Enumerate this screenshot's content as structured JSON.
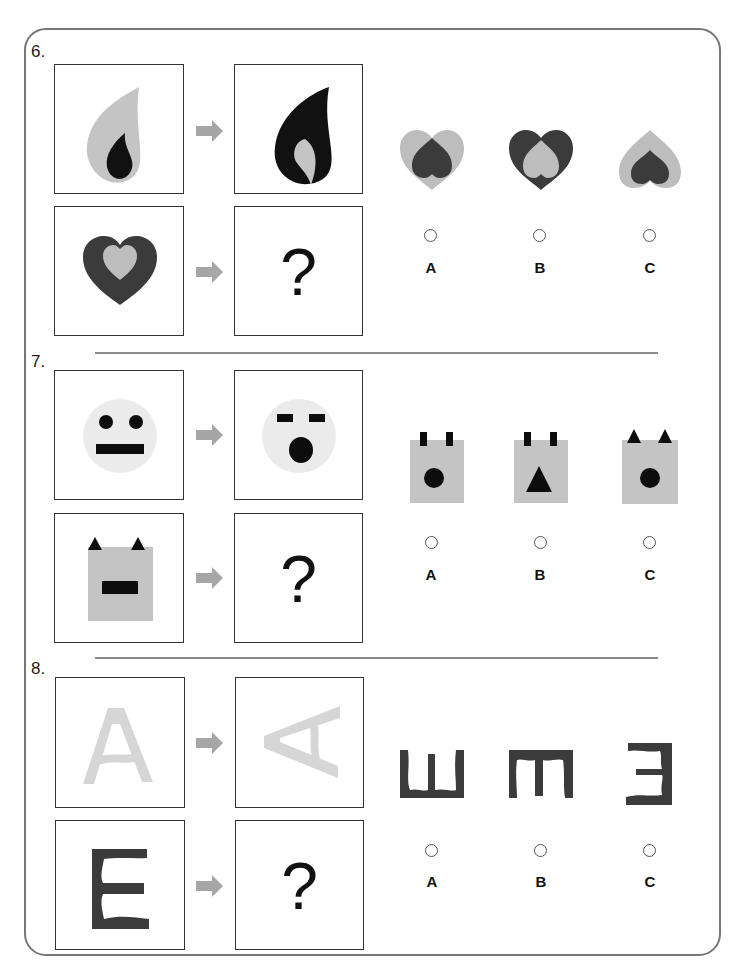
{
  "questions": [
    {
      "number": "6.",
      "example_from": "light-gray teardrop containing small dark teardrop",
      "example_to": "dark teardrop containing small light-gray teardrop",
      "question_from": "dark heart containing light-gray heart",
      "question_mark": "?",
      "options": [
        {
          "label": "A",
          "description": "light-gray heart with dark inverted heart"
        },
        {
          "label": "B",
          "description": "dark heart with light-gray inverted heart"
        },
        {
          "label": "C",
          "description": "light-gray inverted heart with dark inverted heart"
        }
      ]
    },
    {
      "number": "7.",
      "example_from": "light face with round eyes and flat mouth",
      "example_to": "light face with bar eyes and round mouth",
      "question_from": "gray square with triangle ears and bar mouth",
      "question_mark": "?",
      "options": [
        {
          "label": "A",
          "description": "gray square with bar ears and round mouth"
        },
        {
          "label": "B",
          "description": "gray square with bar ears and triangle mouth"
        },
        {
          "label": "C",
          "description": "gray square with triangle ears and round mouth"
        }
      ]
    },
    {
      "number": "8.",
      "example_from": "light-gray letter A",
      "example_to": "light-gray letter A rotated 90 degrees",
      "question_from": "dark letter E",
      "question_mark": "?",
      "options": [
        {
          "label": "A",
          "description": "E rotated to open upward"
        },
        {
          "label": "B",
          "description": "E rotated to open downward"
        },
        {
          "label": "C",
          "description": "E mirrored horizontally"
        }
      ]
    }
  ],
  "colors": {
    "dark": "#3b3b3b",
    "black": "#0d0d0d",
    "light_gray": "#bdbdbd",
    "pale_gray": "#ebebeb",
    "arrow": "#a6a6a6",
    "frame": "#777777"
  }
}
